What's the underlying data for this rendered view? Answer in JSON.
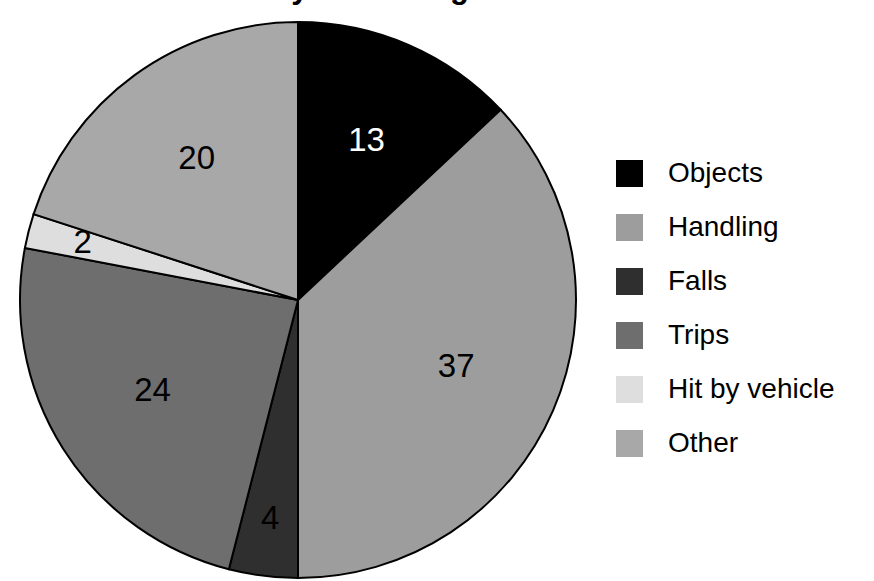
{
  "chart_data": {
    "type": "pie",
    "title": "Accidents by Percentage",
    "title_note": "title is cropped at the top edge of the screenshot",
    "categories": [
      "Objects",
      "Handling",
      "Falls",
      "Trips",
      "Hit by vehicle",
      "Other"
    ],
    "values": [
      13,
      37,
      4,
      24,
      2,
      20
    ],
    "unit": "percent",
    "total": 100,
    "start_angle_deg": 0,
    "direction": "clockwise",
    "legend_position": "right",
    "grid": false,
    "slices": [
      {
        "label": "Objects",
        "value": 13,
        "display": "13",
        "color": "#000000",
        "label_color": "#ffffff"
      },
      {
        "label": "Handling",
        "value": 37,
        "display": "37",
        "color": "#9d9d9d",
        "label_color": "#000000"
      },
      {
        "label": "Falls",
        "value": 4,
        "display": "4",
        "color": "#2f2f2f",
        "label_color": "#000000"
      },
      {
        "label": "Trips",
        "value": 24,
        "display": "24",
        "color": "#6e6e6e",
        "label_color": "#000000"
      },
      {
        "label": "Hit by vehicle",
        "value": 2,
        "display": "2",
        "color": "#dedede",
        "label_color": "#000000"
      },
      {
        "label": "Other",
        "value": 20,
        "display": "20",
        "color": "#a8a8a8",
        "label_color": "#000000"
      }
    ]
  },
  "legend": {
    "items": [
      {
        "label": "Objects",
        "color": "#000000"
      },
      {
        "label": "Handling",
        "color": "#9d9d9d"
      },
      {
        "label": "Falls",
        "color": "#2f2f2f"
      },
      {
        "label": "Trips",
        "color": "#6e6e6e"
      },
      {
        "label": "Hit by vehicle",
        "color": "#dedede"
      },
      {
        "label": "Other",
        "color": "#a8a8a8"
      }
    ]
  },
  "colors": {
    "background": "#ffffff",
    "outline": "#000000",
    "text": "#000000"
  }
}
